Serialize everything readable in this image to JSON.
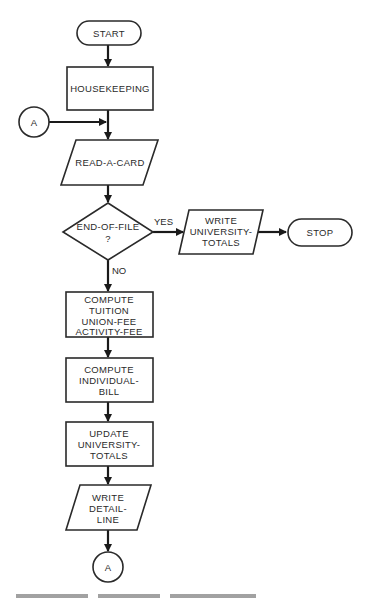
{
  "flowchart": {
    "nodes": {
      "start": {
        "type": "terminal",
        "lines": [
          "START"
        ]
      },
      "housekeeping": {
        "type": "process",
        "lines": [
          "HOUSEKEEPING"
        ]
      },
      "connector_in": {
        "type": "connector",
        "lines": [
          "A"
        ]
      },
      "read_card": {
        "type": "input-output",
        "lines": [
          "READ-A-CARD"
        ]
      },
      "eof": {
        "type": "decision",
        "lines": [
          "END-OF-FILE",
          "?"
        ]
      },
      "write_totals": {
        "type": "input-output",
        "lines": [
          "WRITE",
          "UNIVERSITY-",
          "TOTALS"
        ]
      },
      "stop": {
        "type": "terminal",
        "lines": [
          "STOP"
        ]
      },
      "compute_fees": {
        "type": "process",
        "lines": [
          "COMPUTE",
          "TUITION",
          "UNION-FEE",
          "ACTIVITY-FEE"
        ]
      },
      "compute_bill": {
        "type": "process",
        "lines": [
          "COMPUTE",
          "INDIVIDUAL-",
          "BILL"
        ]
      },
      "update_totals": {
        "type": "process",
        "lines": [
          "UPDATE",
          "UNIVERSITY-",
          "TOTALS"
        ]
      },
      "write_detail": {
        "type": "input-output",
        "lines": [
          "WRITE",
          "DETAIL-",
          "LINE"
        ]
      },
      "connector_out": {
        "type": "connector",
        "lines": [
          "A"
        ]
      }
    },
    "edge_labels": {
      "yes": "YES",
      "no": "NO"
    },
    "edges": [
      [
        "start",
        "housekeeping"
      ],
      [
        "housekeeping",
        "read_card"
      ],
      [
        "connector_in",
        "read_card"
      ],
      [
        "read_card",
        "eof"
      ],
      [
        "eof",
        "write_totals",
        "YES"
      ],
      [
        "write_totals",
        "stop"
      ],
      [
        "eof",
        "compute_fees",
        "NO"
      ],
      [
        "compute_fees",
        "compute_bill"
      ],
      [
        "compute_bill",
        "update_totals"
      ],
      [
        "update_totals",
        "write_detail"
      ],
      [
        "write_detail",
        "connector_out"
      ]
    ]
  }
}
